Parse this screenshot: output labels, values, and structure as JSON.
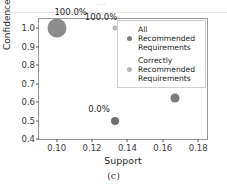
{
  "figure": {
    "subcaption": "(c)",
    "top_artifact": "..."
  },
  "chart_data": {
    "type": "scatter",
    "title": "",
    "xlabel": "Support",
    "ylabel": "Confidence",
    "xlim": [
      0.09,
      0.185
    ],
    "ylim": [
      0.4,
      1.05
    ],
    "xticks": [
      "0.10",
      "0.12",
      "0.14",
      "0.16",
      "0.18"
    ],
    "xtick_values": [
      0.1,
      0.12,
      0.14,
      0.16,
      0.18
    ],
    "yticks": [
      "0.4",
      "0.5",
      "0.6",
      "0.7",
      "0.8",
      "0.9",
      "1.0"
    ],
    "ytick_values": [
      0.4,
      0.5,
      0.6,
      0.7,
      0.8,
      0.9,
      1.0
    ],
    "grid": false,
    "legend_position": "upper right",
    "series": [
      {
        "name": "All Recommended Requirements",
        "color": "#8c8c8c",
        "points": [
          {
            "x": 0.1,
            "y": 1.0,
            "label": "100.0%",
            "size": 19,
            "color": "#8c8c8c",
            "label_dx": 14,
            "label_dy": -11
          },
          {
            "x": 0.133,
            "y": 0.5,
            "label": "0.0%",
            "size": 8,
            "color": "#6e6e6e",
            "label_dx": -16,
            "label_dy": -7
          },
          {
            "x": 0.167,
            "y": 0.62,
            "label": "50.0%",
            "size": 9,
            "color": "#7a7a7a",
            "label_dx": -15,
            "label_dy": -8
          }
        ]
      },
      {
        "name": "Correctly Recommended Requirements",
        "color": "#b9b9b9",
        "points": [
          {
            "x": 0.133,
            "y": 1.0,
            "label": "100.0%",
            "size": 5,
            "color": "#b9b9b9",
            "label_dx": -14,
            "label_dy": -6
          }
        ]
      }
    ]
  },
  "legend": {
    "entries": [
      {
        "label": "All\nRecommended\nRequirements",
        "marker_color": "#808080",
        "marker_size": 5
      },
      {
        "label": "Correctly\nRecommended\nRequirements",
        "marker_color": "#b5b5b5",
        "marker_size": 5
      }
    ]
  }
}
